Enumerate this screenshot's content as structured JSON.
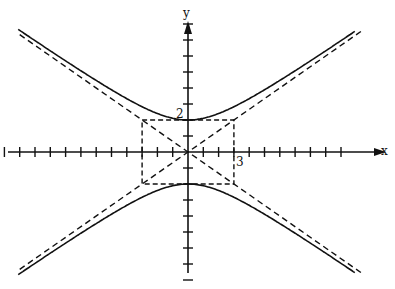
{
  "chart_data": {
    "type": "diagram",
    "title": "",
    "equation": "y^2/4 - x^2/9 = 1",
    "a": 2,
    "b": 3,
    "orientation": "vertical",
    "vertices": [
      [
        0,
        2
      ],
      [
        0,
        -2
      ]
    ],
    "asymptotes": [
      "y = (2/3)x",
      "y = -(2/3)x"
    ],
    "central_box": {
      "x_min": -3,
      "x_max": 3,
      "y_min": -2,
      "y_max": 2,
      "style": "dashed"
    },
    "axes": {
      "x_label": "x",
      "y_label": "y",
      "x_range": [
        -12,
        10
      ],
      "y_range": [
        -8,
        8
      ],
      "tick_spacing": 1,
      "labeled_ticks": [
        {
          "axis": "y",
          "value": 2,
          "text": "2"
        },
        {
          "axis": "x",
          "value": 3,
          "text": "3"
        }
      ]
    },
    "grid": false,
    "legend": null
  },
  "labels": {
    "x_axis": "x",
    "y_axis": "y",
    "tick_y2": "2",
    "tick_x3": "3"
  },
  "colors": {
    "ink": "#111111",
    "background": "#ffffff"
  }
}
